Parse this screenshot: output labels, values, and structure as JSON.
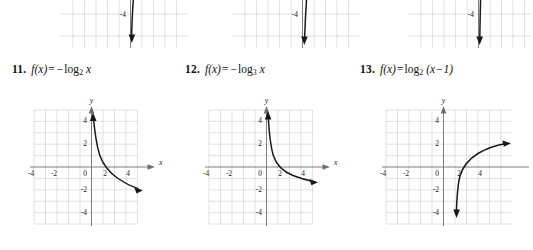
{
  "page": {
    "background": "#ffffff",
    "grid_color": "#c9cdd4",
    "axis_color": "#6f6f6f",
    "curve_color": "#16181c"
  },
  "axis_labels": {
    "x": "x",
    "y": "y"
  },
  "tick_labels": {
    "x": [
      "-4",
      "-2",
      "0",
      "2",
      "4"
    ],
    "y_positive": [
      "4",
      "2"
    ],
    "y_negative": [
      "-2",
      "-4"
    ]
  },
  "top_row_partial_graphs": [
    {
      "id": "partial-graph-left",
      "description": "lower portion of an increasing logarithmic curve",
      "x_ticks": [
        "-4",
        "-2",
        "0",
        "2",
        "4"
      ],
      "y_ticks": [
        "-2",
        "-4"
      ]
    },
    {
      "id": "partial-graph-middle",
      "description": "lower portion of a steep increasing logarithmic curve",
      "x_ticks": [
        "-4",
        "-2",
        "0",
        "2",
        "4"
      ],
      "y_ticks": [
        "-2",
        "-4"
      ],
      "axis_label_x": "x"
    },
    {
      "id": "partial-graph-right",
      "description": "lower portion of an increasing logarithmic curve",
      "x_ticks": [
        "-4",
        "-2",
        "0",
        "2",
        "4"
      ],
      "y_ticks": [
        "-2",
        "-4"
      ]
    }
  ],
  "exercises": [
    {
      "number": "11.",
      "fn": "f(x)",
      "equals": "=",
      "sign": "−",
      "log": "log",
      "base": "2",
      "arg": "x",
      "formula_plain": "f(x) = −log₂ x",
      "graph": {
        "id": "graph-11",
        "type": "line",
        "function": "-log2(x)",
        "xlim": [
          -5,
          5
        ],
        "ylim": [
          -5,
          5
        ],
        "grid": true,
        "vertical_asymptote": 0,
        "x_intercept": 1,
        "points": [
          {
            "x": 0.18,
            "y": 2.47
          },
          {
            "x": 0.25,
            "y": 2.0
          },
          {
            "x": 0.5,
            "y": 1.0
          },
          {
            "x": 1.0,
            "y": 0.0
          },
          {
            "x": 2.0,
            "y": -1.0
          },
          {
            "x": 4.0,
            "y": -2.0
          },
          {
            "x": 5.0,
            "y": -2.32
          }
        ]
      }
    },
    {
      "number": "12.",
      "fn": "f(x)",
      "equals": "=",
      "sign": "−",
      "log": "log",
      "base": "3",
      "arg": "x",
      "formula_plain": "f(x) = −log₃ x",
      "graph": {
        "id": "graph-12",
        "type": "line",
        "function": "-log3(x)",
        "xlim": [
          -5,
          5
        ],
        "ylim": [
          -5,
          5
        ],
        "grid": true,
        "vertical_asymptote": 0,
        "x_intercept": 1,
        "points": [
          {
            "x": 0.1,
            "y": 2.1
          },
          {
            "x": 0.33,
            "y": 1.0
          },
          {
            "x": 1.0,
            "y": 0.0
          },
          {
            "x": 3.0,
            "y": -1.0
          },
          {
            "x": 5.0,
            "y": -1.46
          }
        ]
      }
    },
    {
      "number": "13.",
      "fn": "f(x)",
      "equals": "=",
      "log": "log",
      "base": "2",
      "arg_open": "(x",
      "arg_op": "−",
      "arg_close": "1)",
      "formula_plain": "f(x) = log₂ (x − 1)",
      "graph": {
        "id": "graph-13",
        "type": "line",
        "function": "log2(x-1)",
        "xlim": [
          -5,
          5
        ],
        "ylim": [
          -5,
          5
        ],
        "grid": true,
        "vertical_asymptote": 1,
        "x_intercept": 2,
        "points": [
          {
            "x": 1.06,
            "y": -4.06
          },
          {
            "x": 1.25,
            "y": -2.0
          },
          {
            "x": 1.5,
            "y": -1.0
          },
          {
            "x": 2.0,
            "y": 0.0
          },
          {
            "x": 3.0,
            "y": 1.0
          },
          {
            "x": 5.0,
            "y": 2.0
          }
        ]
      }
    }
  ]
}
